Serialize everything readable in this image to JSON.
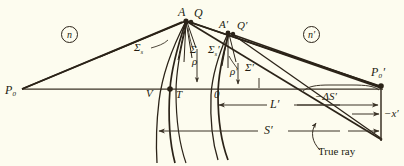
{
  "figure": {
    "background_color": "#fdfcef",
    "ink_color": "#2b2318",
    "line_color": "#3a3226"
  },
  "media": {
    "left_index": "n",
    "right_index": "n′"
  },
  "points": {
    "source": "P₀",
    "image": "P₀′",
    "vertex_v": "V",
    "vertex_t": "T",
    "origin": "0",
    "wavefront_a": "A",
    "ray_point_q": "Q",
    "wavefront_a_prime": "A′",
    "ray_point_q_prime": "Q′"
  },
  "wavefronts": {
    "sigma_s": "Σ",
    "sigma_s_sub": "s",
    "sigma": "Σ",
    "sigma_s_prime": "Σ",
    "sigma_s_prime_sub": "s",
    "sigma_s_prime_mark": "′",
    "sigma_prime": "Σ′",
    "rho": "ρ",
    "rho_prime": "ρ′"
  },
  "dimensions": {
    "l_prime": "L′",
    "s_prime": "S′",
    "delta_s_prime": "−ΔS′",
    "x_prime": "−x′"
  },
  "annotations": {
    "true_ray": "True ray"
  }
}
